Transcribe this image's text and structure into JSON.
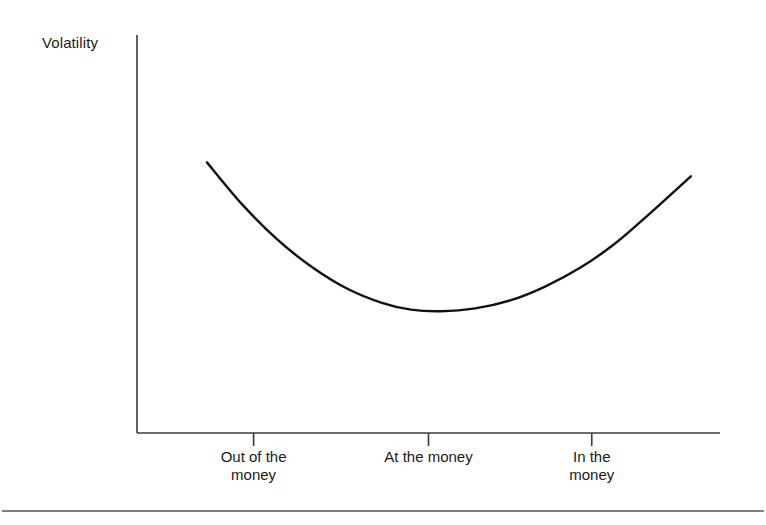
{
  "figure": {
    "width": 766,
    "height": 525,
    "background": "#ffffff",
    "line_color": "#111111",
    "axis_color": "#3a3a3a",
    "rule_color": "#555555"
  },
  "chart_data": {
    "type": "line",
    "title": "",
    "subtitle": "",
    "xlabel": "",
    "ylabel": "Volatility",
    "grid": false,
    "legend": null,
    "annotations": [],
    "axis": {
      "x_axis_visible": true,
      "y_axis_visible": true,
      "x_tick_labels": [
        "Out of the\nmoney",
        "At the money",
        "In the\nmoney"
      ],
      "x_tick_label_lines": [
        [
          "Out of the",
          "money"
        ],
        [
          "At the money"
        ],
        [
          "In the",
          "money"
        ]
      ],
      "x_tick_positions": [
        0.2,
        0.5,
        0.78
      ],
      "y_tick_labels": [],
      "xlim": [
        0,
        1
      ],
      "ylim": [
        0,
        1
      ]
    },
    "series": [
      {
        "name": "Implied volatility smile",
        "x": [
          0.12,
          0.18,
          0.24,
          0.3,
          0.36,
          0.42,
          0.47,
          0.52,
          0.58,
          0.64,
          0.7,
          0.76,
          0.82,
          0.88,
          0.95
        ],
        "y": [
          0.68,
          0.575,
          0.487,
          0.417,
          0.363,
          0.327,
          0.31,
          0.306,
          0.313,
          0.333,
          0.368,
          0.415,
          0.476,
          0.552,
          0.645
        ],
        "smoothing": "catmull-rom",
        "color": "#111111",
        "width": 2.4
      }
    ]
  },
  "footer": {
    "rule_visible": true
  }
}
